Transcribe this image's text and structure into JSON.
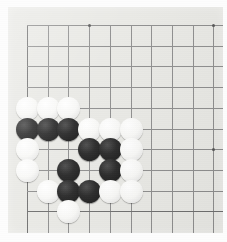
{
  "scene": {
    "title": "Go board close-up",
    "subject": "go-board-corner-position",
    "alt_text": "Photograph of the lower-left corner of a Go board with black and white stones"
  },
  "board": {
    "kind": "go-board",
    "background_color": "#e9e9e5",
    "line_color": "#8d8d8d",
    "edge_line_color": "#6f6f6f",
    "origin_x": 19,
    "origin_y": 18,
    "spacing": 20.7,
    "cols": 10,
    "rows": 10,
    "left_edge_col": 0,
    "top_edge_row": 0,
    "bottom_edge_row": 9,
    "hoshi": [
      {
        "col": 3,
        "row": 0
      },
      {
        "col": 9,
        "row": 0
      },
      {
        "col": 9,
        "row": 6
      }
    ]
  },
  "stones": {
    "black_color": "#1f1f1f",
    "white_color": "#f6f6f4",
    "diameter": 23,
    "black_count": 11,
    "white_count": 16,
    "list": [
      {
        "color": "w",
        "col": 0,
        "row": 4
      },
      {
        "color": "w",
        "col": 1,
        "row": 4
      },
      {
        "color": "w",
        "col": 2,
        "row": 4
      },
      {
        "color": "b",
        "col": 0,
        "row": 5
      },
      {
        "color": "b",
        "col": 1,
        "row": 5
      },
      {
        "color": "b",
        "col": 2,
        "row": 5
      },
      {
        "color": "w",
        "col": 3,
        "row": 5
      },
      {
        "color": "w",
        "col": 4,
        "row": 5
      },
      {
        "color": "w",
        "col": 5,
        "row": 5
      },
      {
        "color": "w",
        "col": 0,
        "row": 6
      },
      {
        "color": "b",
        "col": 3,
        "row": 6
      },
      {
        "color": "b",
        "col": 4,
        "row": 6
      },
      {
        "color": "w",
        "col": 5,
        "row": 6
      },
      {
        "color": "w",
        "col": 0,
        "row": 7
      },
      {
        "color": "b",
        "col": 2,
        "row": 7
      },
      {
        "color": "b",
        "col": 4,
        "row": 7
      },
      {
        "color": "w",
        "col": 5,
        "row": 7
      },
      {
        "color": "w",
        "col": 1,
        "row": 8
      },
      {
        "color": "b",
        "col": 2,
        "row": 8
      },
      {
        "color": "b",
        "col": 3,
        "row": 8
      },
      {
        "color": "w",
        "col": 4,
        "row": 8
      },
      {
        "color": "w",
        "col": 5,
        "row": 8
      },
      {
        "color": "w",
        "col": 2,
        "row": 9
      }
    ]
  }
}
